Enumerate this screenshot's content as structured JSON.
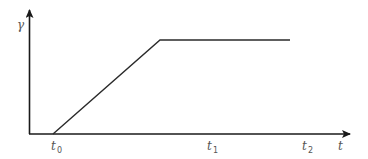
{
  "diagram": {
    "y_axis_label": "γ",
    "x_axis_label": "t",
    "ticks": [
      {
        "base": "t",
        "sub": "0"
      },
      {
        "base": "t",
        "sub": "1"
      },
      {
        "base": "t",
        "sub": "2"
      }
    ],
    "colors": {
      "axis": "#1a1a1a",
      "curve": "#2a2a2a",
      "label": "#555555"
    },
    "curve_points": [
      [
        53,
        134
      ],
      [
        160,
        40
      ],
      [
        290,
        40
      ]
    ]
  }
}
